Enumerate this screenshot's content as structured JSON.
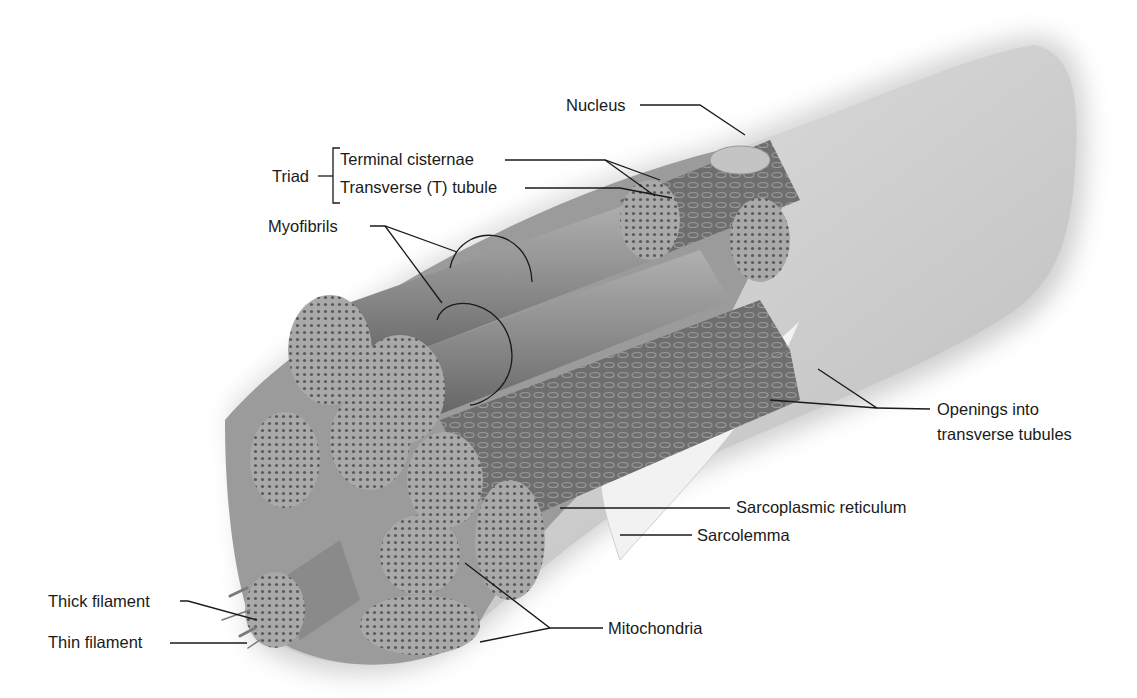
{
  "figure": {
    "colors": {
      "background": "#ffffff",
      "fiber_surface": "#c9c9c9",
      "myofibril": "#8d8d8d",
      "cross_section": "#a6a6a6",
      "leader_line": "#1a1a1a",
      "label_text": "#1a1a1a"
    }
  },
  "labels": {
    "nucleus": "Nucleus",
    "triad": "Triad",
    "terminal_cisternae": "Terminal cisternae",
    "t_tubule": "Transverse (T) tubule",
    "myofibrils": "Myofibrils",
    "openings_line1": "Openings into",
    "openings_line2": "transverse tubules",
    "sarcoplasmic_reticulum": "Sarcoplasmic reticulum",
    "sarcolemma": "Sarcolemma",
    "thick_filament": "Thick filament",
    "thin_filament": "Thin filament",
    "mitochondria": "Mitochondria"
  }
}
